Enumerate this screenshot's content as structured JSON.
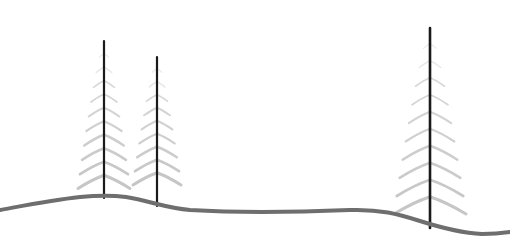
{
  "canvas": {
    "width": 510,
    "height": 252,
    "background_color": "#ffffff",
    "title": "Minimal landscape line drawing with three conifer trees on a rolling hill"
  },
  "palette": {
    "background": "#ffffff",
    "trunk_dark": "#1a1a1a",
    "trunk_mid": "#3a3a3a",
    "branch_gray": "#c6c6c6",
    "branch_gray_light": "#dcdcdc",
    "branch_gray_dark": "#a8a8a8",
    "ground_gray": "#6e6e6e",
    "ground_gray_light": "#8c8c8c"
  },
  "ground": {
    "label": "hill-horizon-line",
    "stroke_color": "#6e6e6e",
    "stroke_width": 4,
    "path": "M 0 210 C 22 206, 52 200, 80 197 C 100 195, 112 195, 126 197 C 150 201, 166 208, 190 210 C 240 213, 300 212, 350 210 C 380 209, 398 214, 420 221 C 442 228, 462 233, 482 234 C 494 234, 503 233, 510 232",
    "peak_y": 195,
    "left_edge_y": 210,
    "right_edge_y": 232
  },
  "trees": [
    {
      "id": "tree-left",
      "label": "conifer-tree-left",
      "trunk_x": 104,
      "top_y": 41,
      "base_y": 198,
      "trunk_width": 2.2,
      "branch_pairs": 10,
      "max_half_span": 26,
      "branch_drop": 13,
      "first_branch_y": 54,
      "branch_spacing": 13.5
    },
    {
      "id": "tree-middle",
      "label": "conifer-tree-middle",
      "trunk_x": 157,
      "top_y": 57,
      "base_y": 206,
      "trunk_width": 2.2,
      "branch_pairs": 9,
      "max_half_span": 24,
      "branch_drop": 12,
      "first_branch_y": 69,
      "branch_spacing": 13.0
    },
    {
      "id": "tree-right",
      "label": "conifer-tree-right",
      "trunk_x": 430,
      "top_y": 28,
      "base_y": 228,
      "trunk_width": 2.6,
      "branch_pairs": 10,
      "max_half_span": 36,
      "branch_drop": 17,
      "first_branch_y": 44,
      "branch_spacing": 17.0
    }
  ]
}
